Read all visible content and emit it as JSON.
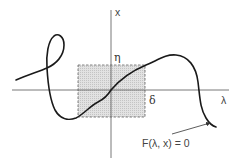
{
  "diagram": {
    "type": "implicit-curve-figure",
    "axes": {
      "vertical_label": "x",
      "horizontal_label": "λ"
    },
    "box_labels": {
      "top": "η",
      "right": "δ"
    },
    "curve_label": "F(λ, x) = 0",
    "colors": {
      "curve": "#1a1a1a",
      "axis": "#555555",
      "box_fill": "#d9d9d9",
      "box_border": "#666666"
    }
  }
}
